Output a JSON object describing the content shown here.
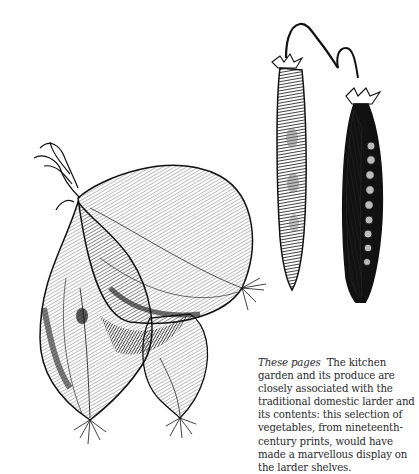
{
  "page": {
    "background": "#ffffff",
    "ink": "#1a1a1a"
  },
  "illustrations": [
    {
      "name": "onions-engraving",
      "subject": "bunch of three onions with dried tops and roots"
    },
    {
      "name": "pea-pods-engraving",
      "subject": "two pea pods hanging from a stem, one closed, one split open showing peas"
    }
  ],
  "caption": {
    "lead": "These pages",
    "body": "The kitchen garden and its produce are closely associated with the traditional domestic larder and its contents: this selection of vegetables, from nineteenth-century prints, would have made a marvellous display on the larder shelves."
  }
}
